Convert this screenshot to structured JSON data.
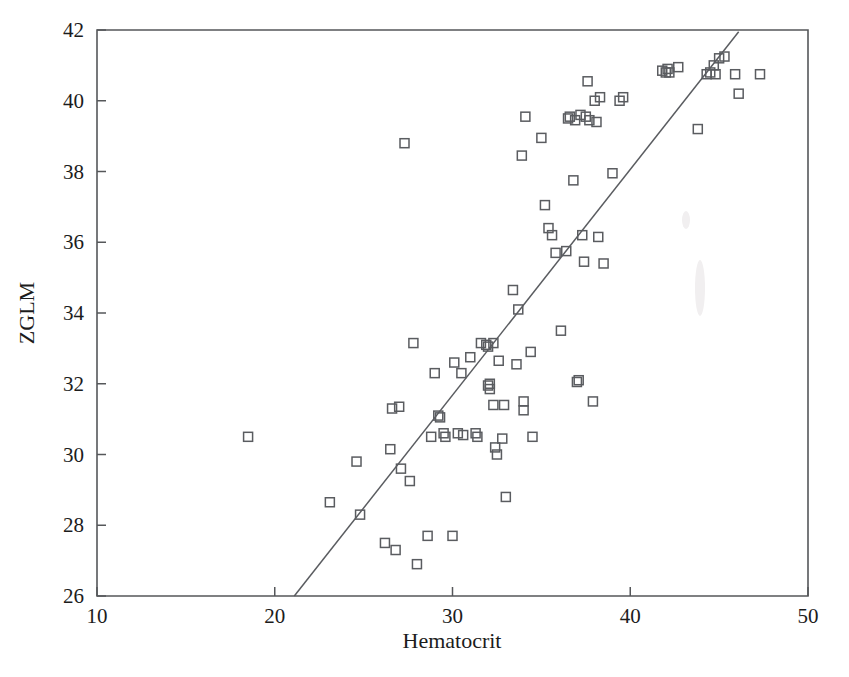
{
  "chart_data": {
    "type": "scatter",
    "title": "",
    "xlabel": "Hematocrit",
    "ylabel": "ZGLM",
    "xlim": [
      10,
      50
    ],
    "ylim": [
      26,
      42
    ],
    "xticks": [
      10,
      20,
      30,
      40,
      50
    ],
    "yticks": [
      26,
      28,
      30,
      32,
      34,
      36,
      38,
      40,
      42
    ],
    "xtick_labels": [
      "10",
      "20",
      "30",
      "40",
      "50"
    ],
    "ytick_labels": [
      "26",
      "28",
      "30",
      "32",
      "34",
      "36",
      "38",
      "40",
      "42"
    ],
    "grid": false,
    "legend": null,
    "marker": "open-square",
    "marker_color": "#5a5c60",
    "line_color": "#5a5c60",
    "points": [
      [
        18.5,
        30.5
      ],
      [
        23.1,
        28.65
      ],
      [
        24.6,
        29.8
      ],
      [
        24.8,
        28.3
      ],
      [
        26.2,
        27.5
      ],
      [
        26.5,
        30.15
      ],
      [
        26.6,
        31.3
      ],
      [
        26.8,
        27.3
      ],
      [
        27.0,
        31.35
      ],
      [
        27.1,
        29.6
      ],
      [
        27.3,
        38.8
      ],
      [
        27.6,
        29.25
      ],
      [
        27.8,
        33.15
      ],
      [
        28.0,
        26.9
      ],
      [
        28.6,
        27.7
      ],
      [
        28.8,
        30.5
      ],
      [
        29.0,
        32.3
      ],
      [
        29.2,
        31.1
      ],
      [
        29.3,
        31.05
      ],
      [
        29.5,
        30.6
      ],
      [
        29.6,
        30.5
      ],
      [
        30.0,
        27.7
      ],
      [
        30.1,
        32.6
      ],
      [
        30.3,
        30.6
      ],
      [
        30.5,
        32.3
      ],
      [
        30.6,
        30.55
      ],
      [
        31.0,
        32.75
      ],
      [
        31.3,
        30.6
      ],
      [
        31.4,
        30.5
      ],
      [
        31.6,
        33.15
      ],
      [
        31.9,
        33.1
      ],
      [
        32.0,
        33.05
      ],
      [
        32.0,
        31.95
      ],
      [
        32.1,
        32.0
      ],
      [
        32.1,
        31.85
      ],
      [
        32.3,
        31.4
      ],
      [
        32.3,
        33.15
      ],
      [
        32.4,
        30.2
      ],
      [
        32.5,
        30.0
      ],
      [
        32.6,
        32.65
      ],
      [
        32.8,
        30.45
      ],
      [
        32.9,
        31.4
      ],
      [
        33.0,
        28.8
      ],
      [
        33.4,
        34.65
      ],
      [
        33.6,
        32.55
      ],
      [
        33.7,
        34.1
      ],
      [
        33.9,
        38.45
      ],
      [
        34.0,
        31.25
      ],
      [
        34.0,
        31.5
      ],
      [
        34.1,
        39.55
      ],
      [
        34.4,
        32.9
      ],
      [
        34.5,
        30.5
      ],
      [
        35.0,
        38.95
      ],
      [
        35.2,
        37.05
      ],
      [
        35.4,
        36.4
      ],
      [
        35.6,
        36.2
      ],
      [
        35.8,
        35.7
      ],
      [
        36.1,
        33.5
      ],
      [
        36.4,
        35.75
      ],
      [
        36.5,
        39.5
      ],
      [
        36.6,
        39.55
      ],
      [
        36.8,
        37.75
      ],
      [
        36.9,
        39.45
      ],
      [
        37.0,
        32.05
      ],
      [
        37.1,
        32.1
      ],
      [
        37.2,
        39.6
      ],
      [
        37.3,
        36.2
      ],
      [
        37.4,
        35.45
      ],
      [
        37.5,
        39.55
      ],
      [
        37.6,
        40.55
      ],
      [
        37.7,
        39.45
      ],
      [
        37.9,
        31.5
      ],
      [
        38.0,
        40.0
      ],
      [
        38.1,
        39.4
      ],
      [
        38.2,
        36.15
      ],
      [
        38.3,
        40.1
      ],
      [
        38.5,
        35.4
      ],
      [
        39.0,
        37.95
      ],
      [
        39.4,
        40.0
      ],
      [
        39.6,
        40.1
      ],
      [
        41.8,
        40.85
      ],
      [
        42.0,
        40.8
      ],
      [
        42.1,
        40.9
      ],
      [
        42.2,
        40.8
      ],
      [
        42.7,
        40.95
      ],
      [
        43.8,
        39.2
      ],
      [
        44.3,
        40.75
      ],
      [
        44.5,
        40.8
      ],
      [
        44.7,
        41.0
      ],
      [
        44.8,
        40.75
      ],
      [
        45.0,
        41.2
      ],
      [
        45.3,
        41.25
      ],
      [
        45.9,
        40.75
      ],
      [
        46.1,
        40.2
      ],
      [
        47.3,
        40.75
      ]
    ],
    "fit_line": {
      "x_start": 21.1,
      "y_start": 26.0,
      "x_end": 46.1,
      "y_end": 41.95
    }
  }
}
